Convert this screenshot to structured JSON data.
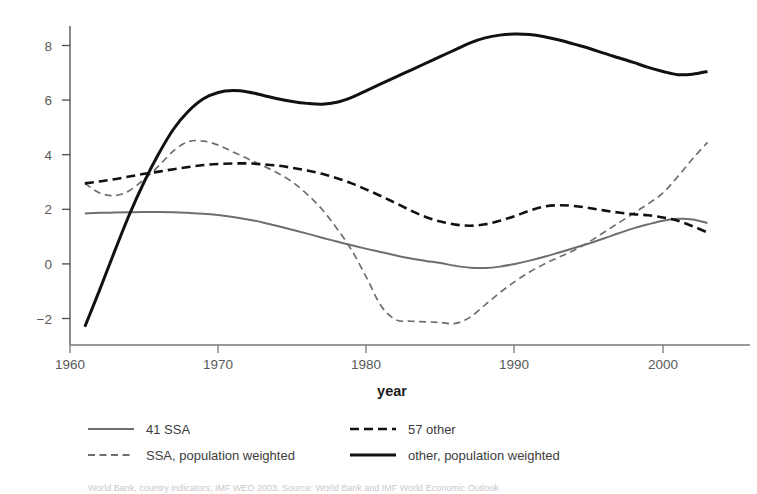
{
  "chart_data": {
    "type": "line",
    "title": "",
    "subtitle": "",
    "xlabel": "year",
    "ylabel": "",
    "xlim": [
      1961,
      2003
    ],
    "ylim": [
      -2.6,
      8.8
    ],
    "grid": false,
    "legend_position": "bottom",
    "xticks": [
      1960,
      1970,
      1980,
      1990,
      2000
    ],
    "xtick_labels": [
      "1960",
      "1970",
      "1980",
      "1990",
      "2000"
    ],
    "yticks": [
      -2,
      0,
      2,
      4,
      6,
      8
    ],
    "ytick_labels": [
      "−2",
      "0",
      "2",
      "4",
      "6",
      "8"
    ],
    "series": [
      {
        "name": "41 SSA",
        "style": "solid",
        "color": "#6e6e6e",
        "width": 2.0,
        "x": [
          1961,
          1962,
          1963,
          1964,
          1965,
          1966,
          1967,
          1968,
          1969,
          1970,
          1971,
          1972,
          1973,
          1974,
          1975,
          1976,
          1977,
          1978,
          1979,
          1980,
          1981,
          1982,
          1983,
          1984,
          1985,
          1986,
          1987,
          1988,
          1989,
          1990,
          1991,
          1992,
          1993,
          1994,
          1995,
          1996,
          1997,
          1998,
          1999,
          2000,
          2001,
          2002,
          2003
        ],
        "values": [
          1.85,
          1.87,
          1.88,
          1.89,
          1.9,
          1.9,
          1.89,
          1.87,
          1.84,
          1.79,
          1.72,
          1.63,
          1.52,
          1.39,
          1.25,
          1.11,
          0.96,
          0.82,
          0.68,
          0.55,
          0.43,
          0.31,
          0.2,
          0.11,
          0.03,
          -0.07,
          -0.14,
          -0.15,
          -0.1,
          0.0,
          0.12,
          0.26,
          0.42,
          0.58,
          0.75,
          0.93,
          1.12,
          1.3,
          1.45,
          1.58,
          1.65,
          1.63,
          1.5
        ],
        "value_range": [
          -0.15,
          1.9
        ]
      },
      {
        "name": "SSA, population weighted",
        "style": "dashed",
        "color": "#6e6e6e",
        "width": 1.7,
        "x": [
          1961,
          1962,
          1963,
          1964,
          1965,
          1966,
          1967,
          1968,
          1969,
          1970,
          1971,
          1972,
          1973,
          1974,
          1975,
          1976,
          1977,
          1978,
          1979,
          1980,
          1981,
          1982,
          1983,
          1984,
          1985,
          1986,
          1987,
          1988,
          1989,
          1990,
          1991,
          1992,
          1993,
          1994,
          1995,
          1996,
          1997,
          1998,
          1999,
          2000,
          2001,
          2002,
          2003
        ],
        "values": [
          2.95,
          2.6,
          2.5,
          2.68,
          3.1,
          3.6,
          4.15,
          4.48,
          4.5,
          4.35,
          4.1,
          3.85,
          3.6,
          3.33,
          3.0,
          2.55,
          2.0,
          1.3,
          0.5,
          -0.5,
          -1.55,
          -2.05,
          -2.1,
          -2.12,
          -2.15,
          -2.18,
          -1.95,
          -1.5,
          -1.05,
          -0.65,
          -0.3,
          0.0,
          0.25,
          0.5,
          0.8,
          1.15,
          1.5,
          1.85,
          2.2,
          2.6,
          3.2,
          3.85,
          4.45
        ],
        "value_range": [
          -2.18,
          4.5
        ]
      },
      {
        "name": "57 other",
        "style": "dashed",
        "color": "#111111",
        "width": 2.6,
        "x": [
          1961,
          1962,
          1963,
          1964,
          1965,
          1966,
          1967,
          1968,
          1969,
          1970,
          1971,
          1972,
          1973,
          1974,
          1975,
          1976,
          1977,
          1978,
          1979,
          1980,
          1981,
          1982,
          1983,
          1984,
          1985,
          1986,
          1987,
          1988,
          1989,
          1990,
          1991,
          1992,
          1993,
          1994,
          1995,
          1996,
          1997,
          1998,
          1999,
          2000,
          2001,
          2002,
          2003
        ],
        "values": [
          2.95,
          3.02,
          3.1,
          3.2,
          3.3,
          3.38,
          3.47,
          3.55,
          3.62,
          3.66,
          3.68,
          3.68,
          3.65,
          3.6,
          3.52,
          3.42,
          3.3,
          3.14,
          2.95,
          2.72,
          2.48,
          2.22,
          1.95,
          1.72,
          1.55,
          1.44,
          1.4,
          1.45,
          1.58,
          1.75,
          1.95,
          2.1,
          2.15,
          2.12,
          2.05,
          1.96,
          1.88,
          1.82,
          1.78,
          1.7,
          1.58,
          1.38,
          1.15
        ],
        "value_range": [
          1.4,
          3.68
        ]
      },
      {
        "name": "other, population weighted",
        "style": "solid",
        "color": "#111111",
        "width": 3.0,
        "x": [
          1961,
          1962,
          1963,
          1964,
          1965,
          1966,
          1967,
          1968,
          1969,
          1970,
          1971,
          1972,
          1973,
          1974,
          1975,
          1976,
          1977,
          1978,
          1979,
          1980,
          1981,
          1982,
          1983,
          1984,
          1985,
          1986,
          1987,
          1988,
          1989,
          1990,
          1991,
          1992,
          1993,
          1994,
          1995,
          1996,
          1997,
          1998,
          1999,
          2000,
          2001,
          2002,
          2003
        ],
        "values": [
          -2.3,
          -0.95,
          0.45,
          1.8,
          3.0,
          4.05,
          4.95,
          5.6,
          6.05,
          6.28,
          6.35,
          6.3,
          6.18,
          6.05,
          5.95,
          5.88,
          5.85,
          5.92,
          6.1,
          6.35,
          6.6,
          6.85,
          7.1,
          7.35,
          7.6,
          7.85,
          8.1,
          8.28,
          8.38,
          8.42,
          8.4,
          8.32,
          8.2,
          8.05,
          7.9,
          7.72,
          7.55,
          7.38,
          7.2,
          7.05,
          6.93,
          6.95,
          7.05
        ],
        "value_range": [
          -2.3,
          8.42
        ]
      }
    ]
  },
  "legend": {
    "entries": [
      {
        "label": "41 SSA",
        "style": "solid",
        "color": "#6e6e6e"
      },
      {
        "label": "57 other",
        "style": "dashed",
        "color": "#111111"
      },
      {
        "label": "SSA, population weighted",
        "style": "dashed",
        "color": "#6e6e6e"
      },
      {
        "label": "other, population weighted",
        "style": "solid",
        "color": "#111111"
      }
    ]
  },
  "caption": {
    "text": "World Bank, country indicators; IMF WEO 2003. Source: World Bank and IMF World Economic Outlook"
  }
}
